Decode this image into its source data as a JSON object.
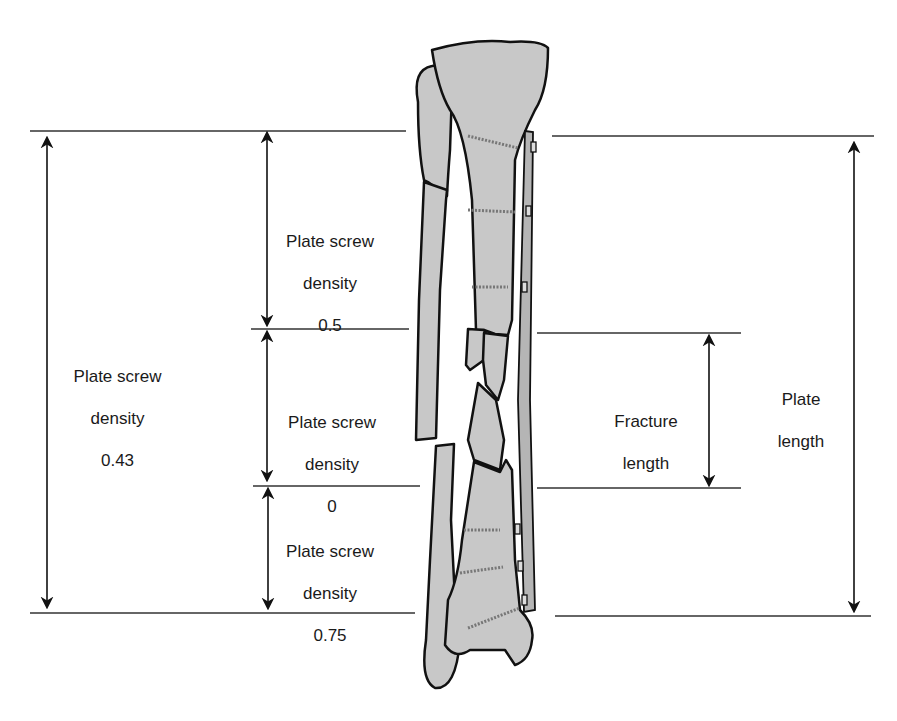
{
  "figure": {
    "colors": {
      "bone_fill": "#c8c8c8",
      "outline": "#111111",
      "line": "#333333",
      "plate": "#b5b5b5"
    }
  },
  "labels": {
    "overall_density": {
      "line1": "Plate screw",
      "line2": "density",
      "value": "0.43"
    },
    "upper_density": {
      "line1": "Plate screw",
      "line2": "density",
      "value": "0.5"
    },
    "middle_density": {
      "line1": "Plate screw",
      "line2": "density",
      "value": "0"
    },
    "lower_density": {
      "line1": "Plate screw",
      "line2": "density",
      "value": "0.75"
    },
    "fracture_length": {
      "line1": "Fracture",
      "line2": "length"
    },
    "plate_length": {
      "line1": "Plate",
      "line2": "length"
    }
  }
}
